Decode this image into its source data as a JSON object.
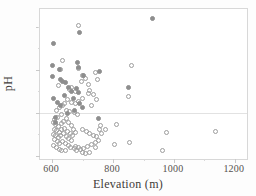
{
  "chart_data": {
    "type": "scatter",
    "title": "",
    "xlabel": "Elevation (m)",
    "ylabel": "pH",
    "xlim": [
      560,
      1240
    ],
    "ylim": [
      3.92,
      7.42
    ],
    "xticks": [
      600,
      800,
      1000,
      1200
    ],
    "xtick_labels": [
      "600",
      "800",
      "1000",
      "1200"
    ],
    "yticks": [
      4.0,
      5.0,
      6.0,
      7.0
    ],
    "ytick_labels": [
      "4.0",
      "5.0",
      "6.0",
      "7.0"
    ],
    "grid": false,
    "legend": "none",
    "reference_lines": [
      {
        "axis": "y",
        "value": 5.0,
        "color": "#e2e2e2"
      }
    ],
    "colors": {
      "open_marker_edge": "#9d9d9d",
      "filled_marker": "#8e8e8e",
      "frame": "#d8d8d8",
      "text": "#55514e"
    },
    "series": [
      {
        "name": "open",
        "marker": "open-circle",
        "points": [
          [
            685,
            7.03
          ],
          [
            633,
            6.22
          ],
          [
            627,
            6.02
          ],
          [
            620,
            5.64
          ],
          [
            663,
            5.58
          ],
          [
            657,
            5.55
          ],
          [
            676,
            5.5
          ],
          [
            686,
            6.04
          ],
          [
            700,
            5.88
          ],
          [
            697,
            5.72
          ],
          [
            708,
            5.8
          ],
          [
            718,
            5.66
          ],
          [
            723,
            5.53
          ],
          [
            742,
            5.95
          ],
          [
            750,
            5.78
          ],
          [
            735,
            5.43
          ],
          [
            745,
            5.3
          ],
          [
            728,
            5.18
          ],
          [
            862,
            6.1
          ],
          [
            852,
            5.37
          ],
          [
            718,
            5.44
          ],
          [
            700,
            5.33
          ],
          [
            688,
            5.26
          ],
          [
            676,
            5.22
          ],
          [
            664,
            5.25
          ],
          [
            651,
            5.3
          ],
          [
            641,
            5.22
          ],
          [
            634,
            5.18
          ],
          [
            623,
            5.12
          ],
          [
            613,
            5.05
          ],
          [
            646,
            5.06
          ],
          [
            658,
            5.02
          ],
          [
            672,
            5.0
          ],
          [
            684,
            4.97
          ],
          [
            631,
            4.95
          ],
          [
            617,
            4.9
          ],
          [
            607,
            4.84
          ],
          [
            604,
            4.78
          ],
          [
            612,
            4.72
          ],
          [
            621,
            4.68
          ],
          [
            629,
            4.74
          ],
          [
            638,
            4.8
          ],
          [
            646,
            4.86
          ],
          [
            655,
            4.78
          ],
          [
            663,
            4.7
          ],
          [
            671,
            4.62
          ],
          [
            606,
            4.62
          ],
          [
            614,
            4.58
          ],
          [
            623,
            4.55
          ],
          [
            632,
            4.6
          ],
          [
            641,
            4.64
          ],
          [
            650,
            4.57
          ],
          [
            659,
            4.52
          ],
          [
            668,
            4.48
          ],
          [
            676,
            4.55
          ],
          [
            603,
            4.5
          ],
          [
            611,
            4.46
          ],
          [
            620,
            4.42
          ],
          [
            628,
            4.47
          ],
          [
            637,
            4.52
          ],
          [
            646,
            4.44
          ],
          [
            655,
            4.4
          ],
          [
            664,
            4.36
          ],
          [
            607,
            4.38
          ],
          [
            616,
            4.33
          ],
          [
            625,
            4.29
          ],
          [
            634,
            4.34
          ],
          [
            643,
            4.28
          ],
          [
            652,
            4.24
          ],
          [
            661,
            4.2
          ],
          [
            605,
            4.24
          ],
          [
            614,
            4.19
          ],
          [
            623,
            4.15
          ],
          [
            632,
            4.13
          ],
          [
            645,
            4.12
          ],
          [
            672,
            4.16
          ],
          [
            681,
            4.12
          ],
          [
            692,
            4.14
          ],
          [
            704,
            4.17
          ],
          [
            715,
            4.22
          ],
          [
            700,
            4.6
          ],
          [
            712,
            4.56
          ],
          [
            723,
            4.52
          ],
          [
            735,
            4.48
          ],
          [
            746,
            4.44
          ],
          [
            757,
            4.6
          ],
          [
            763,
            4.52
          ],
          [
            752,
            4.36
          ],
          [
            741,
            4.3
          ],
          [
            730,
            4.26
          ],
          [
            758,
            4.7
          ],
          [
            775,
            4.62
          ],
          [
            812,
            4.72
          ],
          [
            806,
            4.25
          ],
          [
            855,
            4.3
          ],
          [
            963,
            4.13
          ],
          [
            975,
            4.55
          ],
          [
            1138,
            4.56
          ],
          [
            742,
            4.2
          ],
          [
            722,
            4.08
          ],
          [
            710,
            4.05
          ],
          [
            698,
            4.08
          ],
          [
            688,
            4.18
          ],
          [
            678,
            4.22
          ]
        ]
      },
      {
        "name": "filled",
        "marker": "filled-circle",
        "points": [
          [
            930,
            7.2
          ],
          [
            690,
            6.87
          ],
          [
            605,
            6.62
          ],
          [
            602,
            6.11
          ],
          [
            625,
            6.02
          ],
          [
            682,
            6.18
          ],
          [
            686,
            6.06
          ],
          [
            601,
            5.85
          ],
          [
            628,
            5.78
          ],
          [
            634,
            5.72
          ],
          [
            645,
            5.7
          ],
          [
            654,
            5.6
          ],
          [
            681,
            5.56
          ],
          [
            688,
            5.48
          ],
          [
            703,
            5.88
          ],
          [
            755,
            5.96
          ],
          [
            852,
            5.6
          ],
          [
            662,
            5.5
          ],
          [
            670,
            5.34
          ],
          [
            691,
            5.22
          ],
          [
            604,
            5.34
          ],
          [
            640,
            5.4
          ],
          [
            612,
            4.9
          ],
          [
            650,
            4.98
          ],
          [
            611,
            4.78
          ],
          [
            672,
            5.05
          ],
          [
            700,
            5.12
          ],
          [
            752,
            4.86
          ],
          [
            626,
            5.16
          ],
          [
            616,
            5.24
          ]
        ]
      }
    ]
  }
}
